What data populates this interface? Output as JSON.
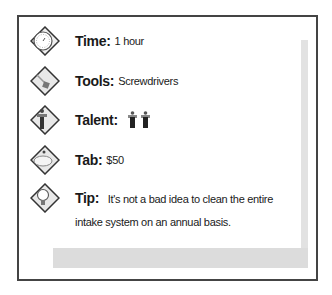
{
  "card": {
    "rows": [
      {
        "icon": "clock-icon",
        "label": "Time:",
        "value": "1 hour"
      },
      {
        "icon": "tools-icon",
        "label": "Tools:",
        "value": "Screwdrivers"
      },
      {
        "icon": "talent-icon",
        "label": "Talent:",
        "value": "",
        "figures": 2
      },
      {
        "icon": "tab-icon",
        "label": "Tab:",
        "value": "$50"
      },
      {
        "icon": "lightbulb-icon",
        "label": "Tip:",
        "value": "It's not a bad idea to clean the entire intake system on an annual basis."
      }
    ]
  },
  "colors": {
    "border": "#444444",
    "shadow": "#dcdcdc",
    "text": "#1a1a1a"
  }
}
